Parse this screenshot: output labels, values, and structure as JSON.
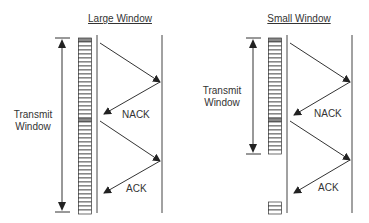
{
  "panels": [
    {
      "title": "Large Window",
      "window_label_line1": "Transmit",
      "window_label_line2": "Window",
      "nack_label": "NACK",
      "ack_label": "ACK"
    },
    {
      "title": "Small Window",
      "window_label_line1": "Transmit",
      "window_label_line2": "Window",
      "nack_label": "NACK",
      "ack_label": "ACK"
    }
  ],
  "colors": {
    "line": "#333333",
    "cell_fill": "#ffffff",
    "cell_shaded": "#8a8a8a"
  }
}
